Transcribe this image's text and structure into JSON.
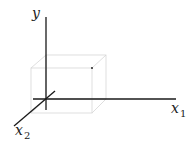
{
  "diagram": {
    "type": "3d-coordinate-axes",
    "axes": {
      "y": {
        "label": "y",
        "subscript": ""
      },
      "x1": {
        "label": "x",
        "subscript": "1"
      },
      "x2": {
        "label": "x",
        "subscript": "2"
      }
    },
    "box": {
      "description": "light gray wireframe cube around origin"
    },
    "point": {
      "description": "small dot at upper front-right corner of cube"
    },
    "colors": {
      "axis": "#1a1a1a",
      "box": "#d6d6d6",
      "point": "#555555"
    }
  }
}
